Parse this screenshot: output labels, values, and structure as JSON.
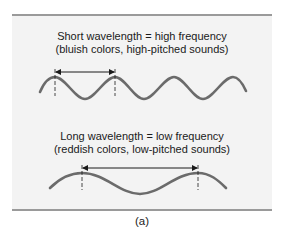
{
  "figure": {
    "short": {
      "line1": "Short wavelength = high frequency",
      "line2": "(bluish colors, high-pitched sounds)"
    },
    "long": {
      "line1": "Long wavelength = low frequency",
      "line2": "(reddish colors, low-pitched sounds)"
    },
    "panel_label": "(a)",
    "colors": {
      "wave": "#6b6b6b",
      "arrow": "#1a1a1a",
      "panel_bg": "#f3f3f3",
      "rule": "#9a9a9a"
    }
  }
}
